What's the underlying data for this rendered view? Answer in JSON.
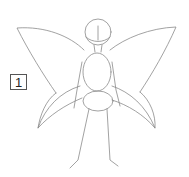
{
  "illustration": {
    "subject": "fairy sketch",
    "step_number": "1",
    "line_color": "#8a8a8a",
    "background": "#ffffff"
  }
}
